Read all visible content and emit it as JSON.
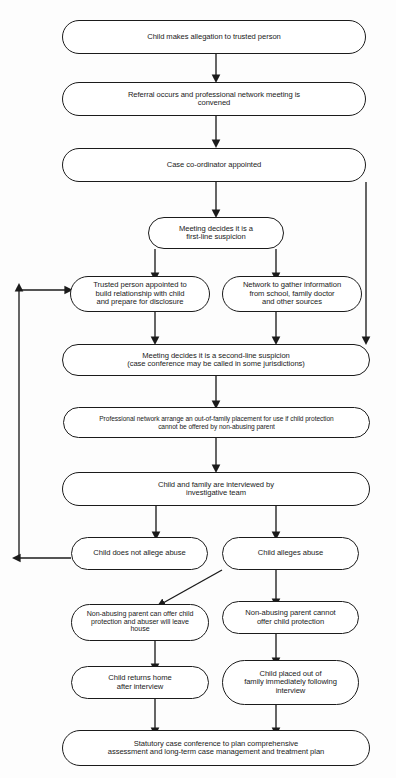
{
  "diagram": {
    "stroke_color": "#1b1b1b",
    "node_fill": "#ffffff",
    "background": "#fdfdfd",
    "nodes": [
      {
        "id": "n1",
        "label": "Child makes allegation to trusted person"
      },
      {
        "id": "n2",
        "label": "Referral occurs and professional network meeting is\nconvened"
      },
      {
        "id": "n3",
        "label": "Case co-ordinator appointed"
      },
      {
        "id": "n4",
        "label": "Meeting decides it is a\nfirst-line suspicion"
      },
      {
        "id": "n5",
        "label": "Trusted person appointed to\nbuild relationship with child\nand prepare for disclosure"
      },
      {
        "id": "n6",
        "label": "Network to gather information\nfrom school, family doctor\nand other sources"
      },
      {
        "id": "n7",
        "label": "Meeting decides it is a second-line suspicion\n(case conference may be called in some jurisdictions)"
      },
      {
        "id": "n8",
        "label": "Professional network arrange an out-of-family placement for use if child protection\ncannot be offered by non-abusing parent"
      },
      {
        "id": "n9",
        "label": "Child and family are interviewed by\ninvestigative team"
      },
      {
        "id": "n10",
        "label": "Child does not allege abuse"
      },
      {
        "id": "n11",
        "label": "Child alleges abuse"
      },
      {
        "id": "n12",
        "label": "Non-abusing parent can offer child\nprotection and abuser will leave\nhouse"
      },
      {
        "id": "n13",
        "label": "Non-abusing parent cannot\noffer child protection"
      },
      {
        "id": "n14",
        "label": "Child returns home\nafter interview"
      },
      {
        "id": "n15",
        "label": "Child placed out of\nfamily immediately following\ninterview"
      },
      {
        "id": "n16",
        "label": "Statutory case conference to plan comprehensive\nassessment and long-term case management and treatment plan"
      }
    ],
    "edges": [
      {
        "from": "n1",
        "to": "n2",
        "kind": "straight-down"
      },
      {
        "from": "n2",
        "to": "n3",
        "kind": "straight-down"
      },
      {
        "from": "n3",
        "to": "n4",
        "kind": "straight-down"
      },
      {
        "from": "n3",
        "to": "n7",
        "kind": "right-bypass"
      },
      {
        "from": "n4",
        "to": "n5",
        "kind": "branch-left"
      },
      {
        "from": "n4",
        "to": "n6",
        "kind": "branch-right"
      },
      {
        "from": "n5",
        "to": "n7",
        "kind": "straight-down"
      },
      {
        "from": "n6",
        "to": "n7",
        "kind": "straight-down"
      },
      {
        "from": "n7",
        "to": "n8",
        "kind": "straight-down"
      },
      {
        "from": "n8",
        "to": "n9",
        "kind": "straight-down"
      },
      {
        "from": "n9",
        "to": "n10",
        "kind": "branch-left"
      },
      {
        "from": "n9",
        "to": "n11",
        "kind": "branch-right"
      },
      {
        "from": "n10",
        "to": "n5",
        "kind": "left-feedback-loop"
      },
      {
        "from": "n11",
        "to": "n12",
        "kind": "diagonal-left-down"
      },
      {
        "from": "n11",
        "to": "n13",
        "kind": "straight-down"
      },
      {
        "from": "n12",
        "to": "n14",
        "kind": "straight-down"
      },
      {
        "from": "n13",
        "to": "n15",
        "kind": "straight-down"
      },
      {
        "from": "n14",
        "to": "n16",
        "kind": "straight-down"
      },
      {
        "from": "n15",
        "to": "n16",
        "kind": "straight-down"
      }
    ]
  }
}
